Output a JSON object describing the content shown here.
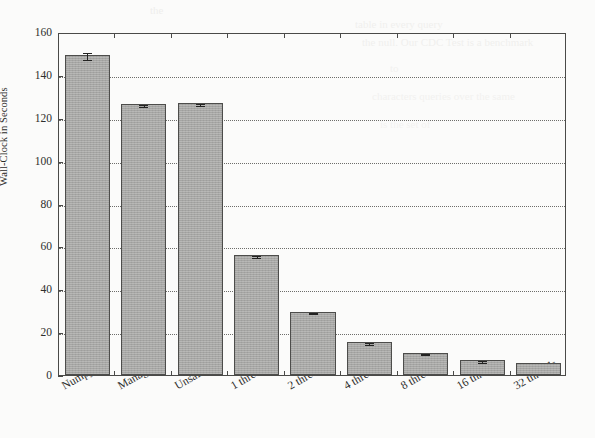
{
  "figure": {
    "ylabel": "Wall-Clock in Seconds",
    "yticks": [
      "0",
      "20",
      "40",
      "60",
      "80",
      "100",
      "120",
      "140",
      "160"
    ],
    "xticklabels": [
      "Numpy",
      "Managed",
      "Unsafe",
      "1 thread",
      "2 threads",
      "4 threads",
      "8 threads",
      "16 threads",
      "32 threads"
    ],
    "bar_fill_color": "#a6a6a4",
    "bar_edge_color": "#4d4d4b",
    "grid_color": "#6d6d6a",
    "axis_color": "#4a4a48",
    "background_color": "#fbfbfa"
  },
  "chart_data": {
    "type": "bar",
    "title": "",
    "xlabel": "",
    "ylabel": "Wall-Clock in Seconds",
    "categories": [
      "Numpy",
      "Managed",
      "Unsafe",
      "1 thread",
      "2 threads",
      "4 threads",
      "8 threads",
      "16 threads",
      "32 threads"
    ],
    "values": [
      149.5,
      126.5,
      127.0,
      56.0,
      29.5,
      15.5,
      10.5,
      7.0,
      5.5
    ],
    "errors": [
      1.6,
      0.4,
      0.5,
      0.3,
      0.3,
      0.4,
      0.3,
      0.3,
      0.0
    ],
    "ylim": [
      0,
      160
    ],
    "ytick_values": [
      0,
      20,
      40,
      60,
      80,
      100,
      120,
      140,
      160
    ],
    "grid": "horizontal-dotted",
    "legend": "none",
    "orientation": "vertical"
  },
  "scan_artifacts": [
    {
      "text": "the",
      "x": 150,
      "y": 4,
      "size": 11,
      "opacity": 0.35
    },
    {
      "text": "table in every query",
      "x": 355,
      "y": 18,
      "size": 11,
      "opacity": 0.3
    },
    {
      "text": "the null. Our CDC Test is a benchmark",
      "x": 362,
      "y": 36,
      "size": 11,
      "opacity": 0.3
    },
    {
      "text": "to",
      "x": 390,
      "y": 62,
      "size": 11,
      "opacity": 0.25
    },
    {
      "text": "characters queries over the same",
      "x": 372,
      "y": 90,
      "size": 11,
      "opacity": 0.25
    },
    {
      "text": "is the set of",
      "x": 380,
      "y": 118,
      "size": 11,
      "opacity": 0.22
    }
  ]
}
